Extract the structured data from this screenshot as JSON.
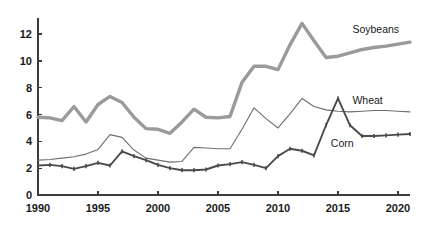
{
  "chart_data": {
    "type": "line",
    "title": "",
    "subtitle": "",
    "xlabel": "",
    "ylabel": "",
    "xlim": [
      1990,
      2021
    ],
    "ylim": [
      0,
      13.2
    ],
    "grid": false,
    "legend_position": "inline-right",
    "x_ticks": [
      1990,
      1995,
      2000,
      2005,
      2010,
      2015,
      2020
    ],
    "y_ticks": [
      0,
      2,
      4,
      6,
      8,
      10,
      12
    ],
    "x": [
      1990,
      1991,
      1992,
      1993,
      1994,
      1995,
      1996,
      1997,
      1998,
      1999,
      2000,
      2001,
      2002,
      2003,
      2004,
      2005,
      2006,
      2007,
      2008,
      2009,
      2010,
      2011,
      2012,
      2013,
      2014,
      2015,
      2016,
      2017,
      2018,
      2019,
      2020,
      2021
    ],
    "series": [
      {
        "name": "Soybeans",
        "color": "#9a9a9a",
        "width": 3.4,
        "markers": "none",
        "label_x": 2016.2,
        "label_y": 12.1,
        "values": [
          5.8,
          5.75,
          5.55,
          6.6,
          5.45,
          6.75,
          7.35,
          6.9,
          5.8,
          4.95,
          4.9,
          4.6,
          5.45,
          6.4,
          5.8,
          5.75,
          5.85,
          8.4,
          9.6,
          9.6,
          9.35,
          11.2,
          12.8,
          11.5,
          10.25,
          10.35,
          10.6,
          10.85,
          11.0,
          11.1,
          11.25,
          11.4
        ]
      },
      {
        "name": "Wheat",
        "color": "#6e6e6e",
        "width": 1.1,
        "markers": "none",
        "label_x": 2016.2,
        "label_y": 6.8,
        "values": [
          2.6,
          2.65,
          2.75,
          2.85,
          3.05,
          3.4,
          4.5,
          4.3,
          3.35,
          2.75,
          2.6,
          2.45,
          2.5,
          3.55,
          3.5,
          3.45,
          3.45,
          4.9,
          6.5,
          5.7,
          5.0,
          6.05,
          7.2,
          6.6,
          6.35,
          6.25,
          6.2,
          6.25,
          6.3,
          6.3,
          6.25,
          6.2
        ]
      },
      {
        "name": "Corn",
        "color": "#4a4a4a",
        "width": 1.9,
        "markers": "tick",
        "label_x": 2014.4,
        "label_y": 3.55,
        "values": [
          2.2,
          2.25,
          2.15,
          1.95,
          2.15,
          2.4,
          2.2,
          3.25,
          2.9,
          2.6,
          2.25,
          2.0,
          1.85,
          1.85,
          1.9,
          2.2,
          2.3,
          2.45,
          2.25,
          2.0,
          2.9,
          3.45,
          3.3,
          2.95,
          5.2,
          7.2,
          5.2,
          4.4,
          4.4,
          4.45,
          4.5,
          4.55
        ]
      }
    ],
    "geometry": {
      "plot_left": 38,
      "plot_right": 410,
      "plot_top": 18,
      "plot_bottom": 195,
      "width": 436,
      "height": 229
    }
  }
}
